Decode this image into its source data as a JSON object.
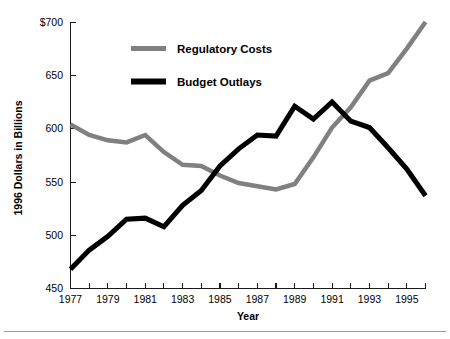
{
  "chart_data": {
    "type": "line",
    "title": "",
    "xlabel": "Year",
    "ylabel": "1996 Dollars in Billions",
    "xlim": [
      1977,
      1996
    ],
    "ylim": [
      450,
      700
    ],
    "grid": false,
    "legend_position": "top-center",
    "y_ticks": [
      450,
      500,
      550,
      600,
      650,
      700
    ],
    "y_tick_labels": [
      "450",
      "500",
      "550",
      "600",
      "650",
      "$700"
    ],
    "x_ticks": [
      1977,
      1978,
      1979,
      1980,
      1981,
      1982,
      1983,
      1984,
      1985,
      1986,
      1987,
      1988,
      1989,
      1990,
      1991,
      1992,
      1993,
      1994,
      1995,
      1996
    ],
    "x_tick_labels": [
      "1977",
      "",
      "1979",
      "",
      "1981",
      "",
      "1983",
      "",
      "1985",
      "",
      "1987",
      "",
      "1989",
      "",
      "1991",
      "",
      "1993",
      "",
      "1995",
      ""
    ],
    "x": [
      1977,
      1978,
      1979,
      1980,
      1981,
      1982,
      1983,
      1984,
      1985,
      1986,
      1987,
      1988,
      1989,
      1990,
      1991,
      1992,
      1993,
      1994,
      1995,
      1996
    ],
    "series": [
      {
        "name": "Regulatory Costs",
        "color": "#808080",
        "values": [
          604,
          594,
          589,
          587,
          594,
          578,
          566,
          565,
          556,
          549,
          546,
          543,
          548,
          573,
          601,
          620,
          645,
          652,
          675,
          700
        ]
      },
      {
        "name": "Budget Outlays",
        "color": "#000000",
        "values": [
          468,
          486,
          499,
          515,
          516,
          508,
          528,
          542,
          565,
          581,
          594,
          593,
          621,
          609,
          625,
          607,
          601,
          582,
          562,
          537
        ]
      }
    ]
  },
  "legend": {
    "items": [
      {
        "label": "Regulatory Costs",
        "color": "#808080"
      },
      {
        "label": "Budget Outlays",
        "color": "#000000"
      }
    ]
  },
  "axes": {
    "x_title": "Year",
    "y_title": "1996 Dollars in Billions"
  }
}
